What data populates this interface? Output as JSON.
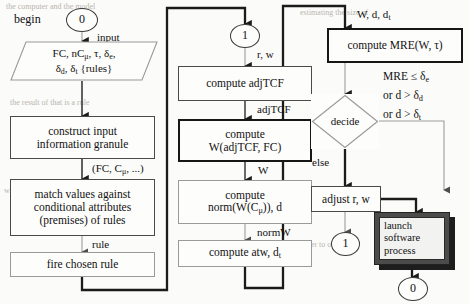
{
  "diagram": {
    "colors": {
      "ink": "#161616",
      "line": "#3a3a3a",
      "faint": "#9a9a9a",
      "paper": "#fbfbfa",
      "shadow": "#1d1d1d"
    }
  },
  "terminals": {
    "begin_label": "begin",
    "start_node": "0",
    "end_node": "0",
    "connector_1_top": "1",
    "connector_1_right": "1"
  },
  "left_column": {
    "input_label": "input",
    "input_line1": "FC, nCμ, τ, δe,",
    "input_line2": "δd, δt {rules}",
    "box_construct_l1": "construct input",
    "box_construct_l2": "information granule",
    "edge_granule": "(FC, Cμ, ...)",
    "box_match_l1": "match values against",
    "box_match_l2": "conditional attributes",
    "box_match_l3": "(premises) of rules",
    "edge_rule": "rule",
    "box_fire": "fire chosen rule"
  },
  "middle_column": {
    "edge_rw": "r, w",
    "box_adjtcf": "compute adjTCF",
    "edge_adjtcf": "adjTCF",
    "box_w_l1": "compute",
    "box_w_l2": "W(adjTCF, FC)",
    "edge_w": "W",
    "box_norm_l1": "compute",
    "box_norm_l2": "norm(W(Cμ)), d",
    "edge_normw": "normW",
    "box_atw": "compute atw, dt"
  },
  "right_column": {
    "edge_wddt": "W, d, dt",
    "box_mre": "compute MRE(W, τ)",
    "cond_l1": "MRE ≤ δe",
    "cond_l2": "or d > δd",
    "cond_l3": "or d > δt",
    "decision": "decide",
    "edge_else": "else",
    "box_adjust": "adjust r, w",
    "box_launch_l1": "launch",
    "box_launch_l2": "software",
    "box_launch_l3": "process"
  }
}
